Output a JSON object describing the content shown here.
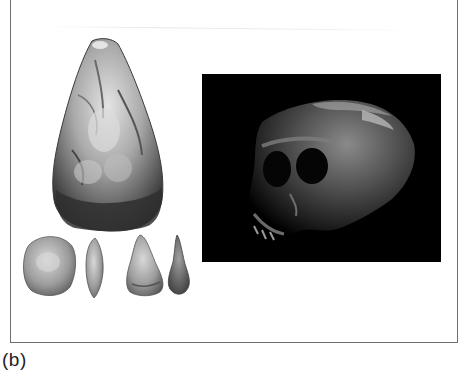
{
  "figure": {
    "caption_label": "(b)",
    "panels": [
      {
        "name": "stone-tools",
        "description": "Acheulean hand axe with smaller flake tools below"
      },
      {
        "name": "skull-photo",
        "description": "Hominin skull photographed on black background"
      }
    ],
    "colors": {
      "frame": "#6e6e6e",
      "photo_background": "#000000",
      "page_background": "#ffffff"
    }
  }
}
